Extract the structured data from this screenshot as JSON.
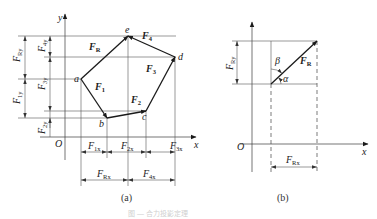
{
  "figure": {
    "caption_faint": "图 — 合力投影定理",
    "panel_a": {
      "label": "(a)",
      "axes": {
        "x": "x",
        "y": "y",
        "origin": "O"
      },
      "points": {
        "a": "a",
        "b": "b",
        "c": "c",
        "d": "d",
        "e": "e"
      },
      "vectors": {
        "F1": {
          "main": "F",
          "sub": "1"
        },
        "F2": {
          "main": "F",
          "sub": "2"
        },
        "F3": {
          "main": "F",
          "sub": "3"
        },
        "F4": {
          "main": "F",
          "sub": "4"
        },
        "FR": {
          "main": "F",
          "sub": "R"
        }
      },
      "dimensions": {
        "FRy": {
          "main": "F",
          "sub": "Ry"
        },
        "F1y": {
          "main": "F",
          "sub": "1y"
        },
        "F4y": {
          "main": "F",
          "sub": "4y"
        },
        "F3y": {
          "main": "F",
          "sub": "3y"
        },
        "F2y": {
          "main": "F",
          "sub": "2y"
        },
        "F1x": {
          "main": "F",
          "sub": "1x"
        },
        "F2x": {
          "main": "F",
          "sub": "2x"
        },
        "F3x": {
          "main": "F",
          "sub": "3x"
        },
        "FRx": {
          "main": "F",
          "sub": "Rx"
        },
        "F4x": {
          "main": "F",
          "sub": "4x"
        }
      }
    },
    "panel_b": {
      "label": "(b)",
      "axes": {
        "x": "x",
        "origin": "O"
      },
      "vector": {
        "main": "F",
        "sub": "R"
      },
      "angles": {
        "alpha": "α",
        "beta": "β"
      },
      "dimensions": {
        "FRy": {
          "main": "F",
          "sub": "Ry"
        },
        "FRx": {
          "main": "F",
          "sub": "Rx"
        }
      }
    }
  }
}
